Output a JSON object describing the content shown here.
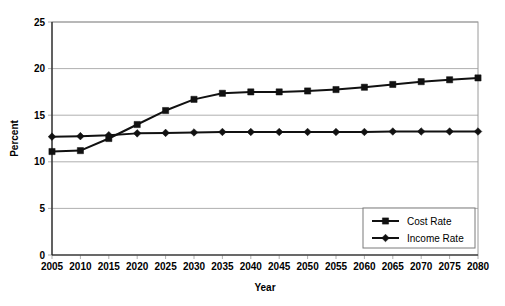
{
  "chart_data": {
    "type": "line",
    "title": "",
    "xlabel": "Year",
    "ylabel": "Percent",
    "categories": [
      2005,
      2010,
      2015,
      2020,
      2025,
      2030,
      2035,
      2040,
      2045,
      2050,
      2055,
      2060,
      2065,
      2070,
      2075,
      2080
    ],
    "x_tick_labels": [
      "2005",
      "2010",
      "2015",
      "2020",
      "2025",
      "2030",
      "2035",
      "2040",
      "2045",
      "2050",
      "2055",
      "2060",
      "2065",
      "2070",
      "2075",
      "2080"
    ],
    "y_tick_labels": [
      "0",
      "5",
      "10",
      "15",
      "20",
      "25"
    ],
    "y_ticks": [
      0,
      5,
      10,
      15,
      20,
      25
    ],
    "ylim": [
      0,
      25
    ],
    "xlim": [
      2005,
      2080
    ],
    "grid": true,
    "grid_axis": "y",
    "legend_position": "bottom-right",
    "series": [
      {
        "name": "Cost Rate",
        "marker": "square",
        "color": "#111111",
        "values": [
          11.1,
          11.2,
          12.5,
          14.0,
          15.5,
          16.7,
          17.35,
          17.5,
          17.5,
          17.6,
          17.75,
          18.0,
          18.3,
          18.6,
          18.8,
          19.0
        ]
      },
      {
        "name": "Income Rate",
        "marker": "diamond",
        "color": "#111111",
        "values": [
          12.7,
          12.75,
          12.85,
          13.05,
          13.1,
          13.15,
          13.2,
          13.2,
          13.2,
          13.2,
          13.2,
          13.2,
          13.25,
          13.25,
          13.25,
          13.25
        ]
      }
    ]
  },
  "legend": {
    "items": [
      {
        "label": "Cost Rate",
        "marker": "square"
      },
      {
        "label": "Income Rate",
        "marker": "diamond"
      }
    ]
  },
  "axes": {
    "y_title": "Percent",
    "x_title": "Year"
  }
}
